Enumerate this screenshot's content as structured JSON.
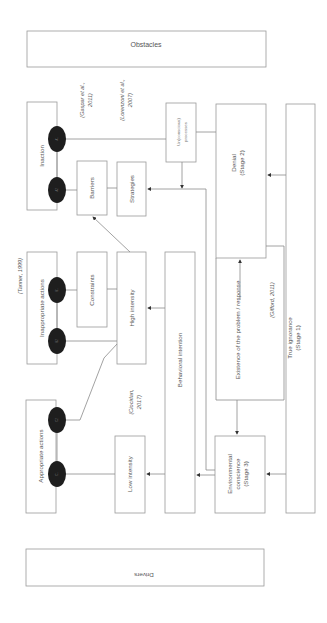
{
  "diagram": {
    "orientation": "rotated-90",
    "boxes": {
      "obstacles": "Obstacles",
      "drivers": "Drivers",
      "inaction": "Inaction",
      "inappropriate_actions": "Inappropriate actions",
      "appropriate_actions": "Appropriate actions",
      "barriers": "Barriers",
      "strategies": "Strategies",
      "constraints": "Constraints",
      "high_intensity": "High intensity",
      "low_intensity": "Low intensity",
      "behavioral_intention": "Behavioral intention",
      "unconscious_processes": [
        "Un(conscious)",
        "processes"
      ],
      "denial": [
        "Denial",
        "(Stage 2)"
      ],
      "environmental_conscience": [
        "Environmental",
        "conscience",
        "(Stage 3)"
      ],
      "existence_of_problem": "Existence of the problem / response",
      "true_ignorance": [
        "True ignorance",
        "(Stage 1)"
      ]
    },
    "citations": {
      "gaspar": [
        "(Gaspar et al.,",
        "2011)"
      ],
      "lorenzoni": [
        "(Lorenzoni et al.,",
        "2007)"
      ],
      "tanner": "(Tanner, 1999)",
      "ciocirlan": [
        "(Ciocirlan,",
        "2017)"
      ],
      "gifford": "(Gifford, 2011)"
    },
    "nodes": [
      "A1",
      "A2",
      "B1",
      "B2",
      "C1",
      "C2"
    ],
    "colors": {
      "box_stroke": "#9a9a9a",
      "line": "#8a8a8a",
      "node_fill": "#1e1e1e",
      "text": "#555555"
    }
  }
}
